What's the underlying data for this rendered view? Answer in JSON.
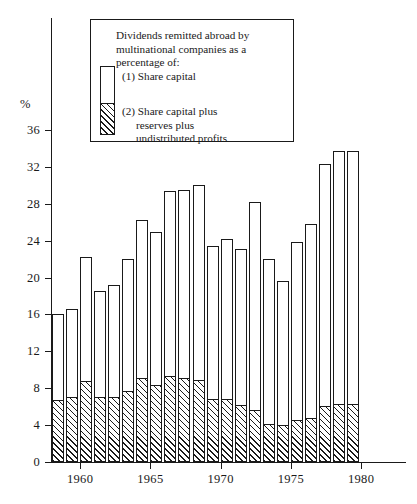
{
  "chart_data": {
    "type": "bar",
    "title": "",
    "xlabel": "",
    "ylabel": "%",
    "ylim": [
      0,
      38
    ],
    "xlim": [
      1957.5,
      1980.5
    ],
    "grid": false,
    "legend_position": "top-center-inset",
    "y_ticks": [
      0,
      4,
      8,
      12,
      16,
      20,
      24,
      28,
      32,
      36
    ],
    "y_tick_labels": [
      "0",
      "4",
      "8",
      "12",
      "16",
      "20",
      "24",
      "28",
      "32",
      "36"
    ],
    "x_ticks": [
      1960,
      1965,
      1970,
      1975,
      1980
    ],
    "x_tick_labels": [
      "1960",
      "1965",
      "1970",
      "1975",
      "1980"
    ],
    "categories": [
      1958,
      1959,
      1960,
      1961,
      1962,
      1963,
      1964,
      1965,
      1966,
      1967,
      1968,
      1969,
      1970,
      1971,
      1972,
      1973,
      1974,
      1975,
      1976,
      1977,
      1978,
      1979
    ],
    "series": [
      {
        "name": "(1) Share capital",
        "style": "outline",
        "values": [
          16.1,
          16.6,
          22.2,
          18.5,
          19.2,
          22.0,
          26.3,
          24.9,
          29.4,
          29.5,
          30.0,
          23.4,
          24.2,
          23.1,
          28.2,
          22.0,
          19.6,
          23.9,
          25.8,
          32.3,
          33.7,
          33.7
        ]
      },
      {
        "name": "(2) Share capital plus reserves plus undistributed profits",
        "style": "hatched",
        "values": [
          6.7,
          7.0,
          8.8,
          7.1,
          7.0,
          7.7,
          9.1,
          8.3,
          9.3,
          9.1,
          8.9,
          6.8,
          6.8,
          6.2,
          5.6,
          4.1,
          4.0,
          4.6,
          4.8,
          6.1,
          6.3,
          6.3
        ]
      }
    ]
  },
  "legend": {
    "title_line_1": "Dividends remitted abroad by",
    "title_line_2": "multinational companies as a",
    "title_line_3": "percentage of:",
    "item_1": "(1) Share capital",
    "item_2_line_1": "(2) Share capital plus",
    "item_2_line_2": "reserves plus",
    "item_2_line_3": "undistributed profits"
  },
  "axis": {
    "y_unit_label": "%"
  }
}
